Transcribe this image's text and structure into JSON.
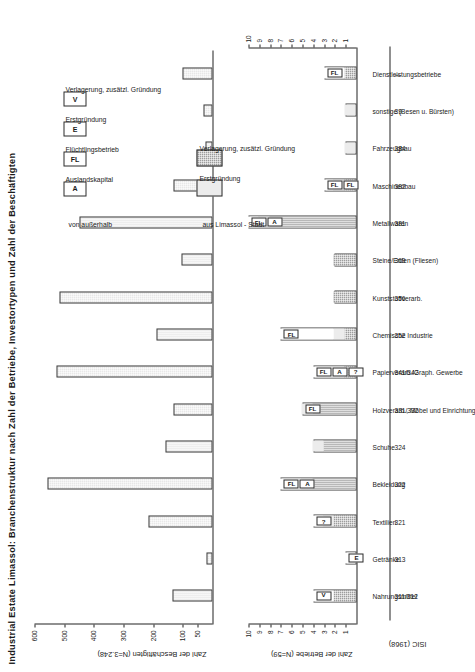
{
  "title": "Industrial Estate Limassol: Branchenstruktur nach Zahl der Betriebe, Investortypen und Zahl der Beschäftigten",
  "axes": {
    "establishments_label": "Zahl der Betriebe (N=59)",
    "employees_label": "Zahl der Beschäftigten (N=3.248)",
    "isic_header": "ISIC (1968)"
  },
  "legend": {
    "group_local_title": "aus Limassol - Stadt",
    "group_local_items": [
      {
        "key": "erstgruendung",
        "label": "Erstgründung",
        "fill": "#ececec"
      },
      {
        "key": "verlagerung",
        "label": "Verlagerung, zusätzl. Gründung",
        "fill": "#9d9d9d"
      }
    ],
    "group_outside_title": "von außerhalb",
    "group_outside_items": [
      {
        "key": "A",
        "label": "Auslandskapital"
      },
      {
        "key": "FL",
        "label": "Flüchtlingsbetrieb"
      },
      {
        "key": "E",
        "label": "Erstgründung"
      },
      {
        "key": "V",
        "label": "Verlagerung, zusätzl. Gründung"
      }
    ]
  },
  "chart_data": {
    "type": "bar",
    "title": "Industrial Estate Limassol: Branchenstruktur nach Zahl der Betriebe, Investortypen und Zahl der Beschäftigten",
    "categories": [
      "Nahrungsmittel",
      "Getränke",
      "Textilien",
      "Bekleidung",
      "Schuhe",
      "Holzverarb., Möbel und Einrichtung",
      "Papierverarb./Graph. Gewerbe",
      "Chemische Industrie",
      "Kunststoffverarb.",
      "Steine/Erden (Fliesen)",
      "Metallwaren",
      "Maschinenbau",
      "Fahrzeugbau",
      "sonstige (Besen u. Bürsten)",
      "Dienstleistungsbetriebe"
    ],
    "isic_codes": [
      "311/312",
      "313",
      "321",
      "322",
      "324",
      "331/332",
      "341/342",
      "352",
      "356",
      "369",
      "381",
      "382",
      "384",
      "39",
      "—"
    ],
    "panels": [
      {
        "name": "Zahl der Betriebe",
        "ylabel": "Zahl der Betriebe (N=59)",
        "ylim": [
          0,
          10
        ],
        "yticks": [
          1,
          2,
          3,
          4,
          5,
          6,
          7,
          8,
          9,
          10
        ],
        "series": [
          {
            "name": "Verlagerung, zusätzl. Gründung",
            "values": [
              2,
              0,
              2,
              4,
              3,
              4,
              1,
              1,
              2,
              2,
              8,
              1,
              0,
              0,
              1
            ]
          },
          {
            "name": "Erstgründung",
            "values": [
              0,
              0,
              1,
              1,
              1,
              1,
              0,
              1,
              0,
              0,
              1,
              1,
              1,
              1,
              0
            ]
          },
          {
            "name": "von außerhalb",
            "values": [
              2,
              1,
              1,
              2,
              0,
              0,
              3,
              5,
              0,
              0,
              1,
              1,
              0,
              0,
              2
            ]
          }
        ],
        "totals": [
          4,
          1,
          4,
          7,
          4,
          5,
          4,
          7,
          2,
          2,
          10,
          3,
          1,
          1,
          3
        ],
        "markers": [
          [
            "V"
          ],
          [
            "E"
          ],
          [
            "?"
          ],
          [
            "FL",
            "A"
          ],
          [],
          [
            "FL"
          ],
          [
            "FL",
            "A",
            "?"
          ],
          [
            "FL"
          ],
          [],
          [],
          [
            "FL",
            "A"
          ],
          [
            "FL",
            "FL"
          ],
          [],
          [],
          [
            "FL"
          ]
        ]
      },
      {
        "name": "Zahl der Beschäftigten",
        "ylabel": "Zahl der Beschäftigten (N=3.248)",
        "ylim": [
          0,
          600
        ],
        "yticks": [
          50,
          100,
          200,
          300,
          400,
          500,
          600
        ],
        "values": [
          135,
          20,
          215,
          555,
          160,
          130,
          525,
          190,
          515,
          105,
          450,
          130,
          25,
          30,
          100
        ]
      }
    ]
  }
}
